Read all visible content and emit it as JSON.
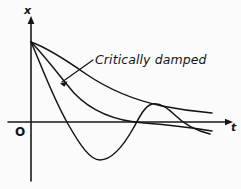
{
  "figure": {
    "background_color": "#fbfbfc",
    "ink_color": "#141414"
  },
  "axes": {
    "y_axis_label": "x",
    "x_axis_label": "t",
    "origin_label": "O",
    "x_axis_y_px": 122,
    "y_axis_x_px": 31,
    "x_axis_start_px": 8,
    "x_axis_end_px": 232,
    "y_axis_top_px": 18,
    "y_axis_bottom_px": 181,
    "has_arrowheads": true,
    "has_ticks": false,
    "has_gridlines": false
  },
  "annotations": [
    {
      "name": "critically-damped-label",
      "text": "Critically damped",
      "text_x_px": 95,
      "text_y_px": 64,
      "leader_from_px": [
        92,
        61
      ],
      "leader_to_px": [
        62,
        81
      ],
      "points_to_curve": "critically-damped"
    }
  ],
  "chart_data": {
    "type": "line",
    "xlabel": "t",
    "ylabel": "x",
    "origin_label": "O",
    "grid": false,
    "legend": "inline-annotation",
    "axis_note": "Unitless axes; all curves start at the same positive initial displacement x0 at t = 0.",
    "common_start_point": {
      "t": 0,
      "x": 1.0
    },
    "series": [
      {
        "name": "overdamped",
        "label": "Overdamped",
        "description": "Slowest decaying curve; stays positive, approaches the t axis asymptotically from above without crossing it.",
        "t": [
          0.0,
          0.12,
          0.25,
          0.4,
          0.55,
          0.7,
          0.85,
          1.0
        ],
        "x": [
          1.0,
          0.83,
          0.66,
          0.49,
          0.36,
          0.27,
          0.22,
          0.19
        ],
        "path_px": "M31,42 C48,48 66,60 86,74 C108,89 134,100 162,106 C182,110 200,112 212,113"
      },
      {
        "name": "critically-damped",
        "label": "Critically damped",
        "description": "Returns to zero as fast as possible without oscillating; crosses close to the axis and flattens just below it at large t.",
        "t": [
          0.0,
          0.1,
          0.22,
          0.35,
          0.5,
          0.65,
          0.8,
          1.0
        ],
        "x": [
          1.0,
          0.68,
          0.42,
          0.22,
          0.09,
          0.01,
          -0.03,
          -0.06
        ],
        "path_px": "M31,42 C44,55 58,74 74,93 C92,112 116,121 144,123 C170,125 194,128 212,131"
      },
      {
        "name": "underdamped",
        "label": "Underdamped (oscillatory)",
        "description": "Oscillates: dips well below the t axis to a trough, rises back above the axis to a smaller hump, then decays toward zero.",
        "t": [
          0.0,
          0.1,
          0.2,
          0.3,
          0.42,
          0.52,
          0.62,
          0.72,
          0.85,
          1.0
        ],
        "x": [
          1.0,
          0.52,
          0.05,
          -0.38,
          -0.55,
          -0.3,
          0.02,
          0.2,
          0.1,
          -0.08
        ],
        "trough_px": [
          95,
          160
        ],
        "trough_value": -0.55,
        "crest_px": [
          148,
          103
        ],
        "crest_value": 0.2,
        "zero_crossings_px": [
          70,
          126,
          186
        ],
        "path_px": "M31,42 C40,62 52,96 68,124 C80,145 90,160 100,160 C112,160 124,145 134,127 C140,116 145,106 152,104 C160,102 168,108 176,116 C186,126 198,131 210,134"
      }
    ]
  }
}
